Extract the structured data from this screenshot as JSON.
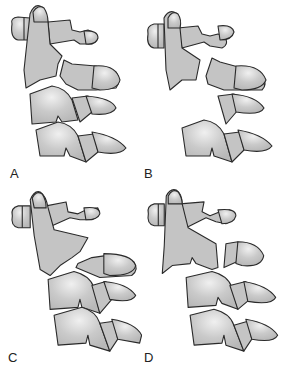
{
  "figure": {
    "panels": [
      {
        "id": "A",
        "label": "A",
        "description": "C2 fracture through pars with minimal displacement"
      },
      {
        "id": "B",
        "label": "B",
        "description": "C2 fracture with angulation and displacement"
      },
      {
        "id": "C",
        "label": "C",
        "description": "C2 fracture with C2-C3 disruption"
      },
      {
        "id": "D",
        "label": "D",
        "description": "C2 fracture with facet dislocation"
      }
    ],
    "colors": {
      "bone_fill": "#c8c8c8",
      "bone_highlight": "#eeeeee",
      "outline": "#2a2a2a",
      "background": "#ffffff"
    }
  }
}
